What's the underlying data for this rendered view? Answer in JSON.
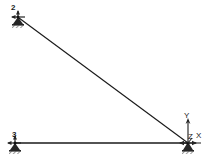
{
  "canvas": {
    "width": 206,
    "height": 162,
    "background_color": "#ffffff",
    "line_color": "#1a1a1a",
    "support_color": "#262626"
  },
  "diagram": {
    "type": "structural-frame-model",
    "nodes": [
      {
        "id": "1",
        "label": "",
        "x": 188,
        "y": 143,
        "support": "pinned",
        "label_visible": false
      },
      {
        "id": "2",
        "label": "2",
        "x": 18,
        "y": 17,
        "support": "pinned",
        "label_visible": true
      },
      {
        "id": "3",
        "label": "3",
        "x": 15,
        "y": 143,
        "support": "pinned",
        "label_visible": true
      }
    ],
    "members": [
      {
        "id": "member-diagonal",
        "from": "2",
        "to": "1"
      },
      {
        "id": "member-horizontal",
        "from": "3",
        "to": "1"
      }
    ]
  },
  "axes": {
    "origin_x": 188,
    "origin_y": 143,
    "y_label": "Y",
    "z_label": "Z",
    "x_label": "X"
  }
}
